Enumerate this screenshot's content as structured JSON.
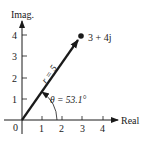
{
  "diagram": {
    "type": "complex-plane-polar-form",
    "axes": {
      "x_label": "Real",
      "y_label": "Imag.",
      "origin_label": "0",
      "x_ticks": [
        "1",
        "2",
        "3",
        "4"
      ],
      "y_ticks": [
        "1",
        "2",
        "3",
        "4"
      ]
    },
    "point": {
      "label": "3 + 4j",
      "real": 3,
      "imag": 4
    },
    "vector": {
      "magnitude_label": "r = 5",
      "magnitude": 5
    },
    "angle": {
      "label": "θ = 53.1°",
      "degrees": 53.1
    },
    "colors": {
      "ink": "#1a1a1a",
      "background": "#ffffff"
    }
  }
}
